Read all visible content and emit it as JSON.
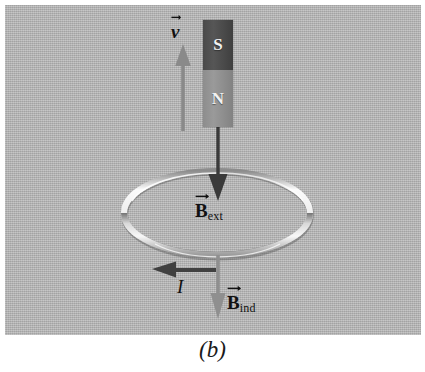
{
  "figure": {
    "caption": "(b)",
    "panel_background": "#b3b3b3"
  },
  "magnet": {
    "south_pole_label": "S",
    "north_pole_label": "N",
    "south_pole_color": "#4a4a4a",
    "north_pole_color": "#8d8d8d",
    "pole_text_color": "#f2f2f2"
  },
  "labels": {
    "velocity": {
      "symbol": "v",
      "subscript": "",
      "has_vector_arrow": true,
      "italic": true
    },
    "b_external": {
      "symbol": "B",
      "subscript": "ext",
      "has_vector_arrow": true,
      "italic": false
    },
    "b_induced": {
      "symbol": "B",
      "subscript": "ind",
      "has_vector_arrow": true,
      "italic": false
    },
    "current": {
      "symbol": "I",
      "subscript": "",
      "has_vector_arrow": false,
      "italic": true
    }
  },
  "arrows": {
    "velocity": {
      "direction": "up",
      "color": "#8a8a8a",
      "x": 178,
      "tip_y": 40,
      "tail_y": 126
    },
    "b_external": {
      "direction": "down",
      "color": "#3a3a3a",
      "x": 213,
      "tail_y": 124,
      "tip_y": 196
    },
    "b_induced": {
      "direction": "down",
      "color": "#8f8f8f",
      "x": 213,
      "tail_y": 252,
      "tip_y": 314
    },
    "current": {
      "direction": "left",
      "color": "#404040",
      "y": 265,
      "tail_x": 210,
      "tip_x": 148
    }
  },
  "loop": {
    "name": "conducting-loop",
    "center_x": 212,
    "center_y": 208,
    "radius_x": 93,
    "radius_y": 42,
    "ring_light_color": "#f0f0f0",
    "ring_shadow_color": "#787878"
  }
}
